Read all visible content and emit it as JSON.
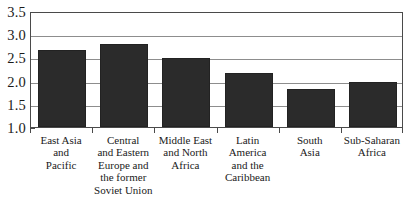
{
  "chart_data": {
    "type": "bar",
    "title": "",
    "subtitle": "",
    "xlabel": "",
    "ylabel": "",
    "ylim": [
      1.0,
      3.5
    ],
    "grid": true,
    "legend": null,
    "legend_position": "none",
    "orientation": "vertical",
    "bar_color": "#2b2b2b",
    "categories": [
      "East Asia\nand\nPacific",
      "Central\nand Eastern\nEurope and\nthe former\nSoviet Union",
      "Middle East\nand North\nAfrica",
      "Latin\nAmerica\nand the\nCaribbean",
      "South\nAsia",
      "Sub-Saharan\nAfrica"
    ],
    "values": [
      2.65,
      2.78,
      2.48,
      2.17,
      1.83,
      1.98
    ],
    "ytick_labels": [
      "3.5",
      "3.0",
      "2.5",
      "2.0",
      "1.5",
      "1.0"
    ],
    "ytick_values": [
      3.5,
      3.0,
      2.5,
      2.0,
      1.5,
      1.0
    ]
  }
}
